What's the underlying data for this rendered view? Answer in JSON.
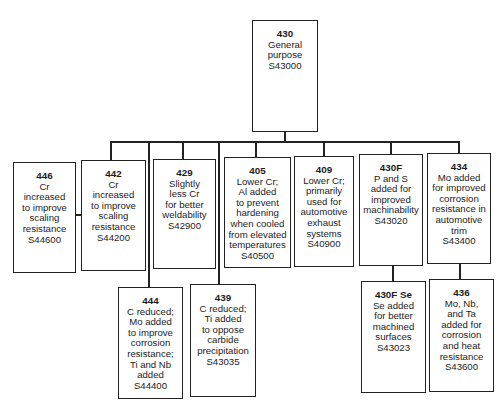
{
  "diagram": {
    "root": {
      "id": "430",
      "desc": "General\npurpose",
      "code": "S43000"
    },
    "level1": [
      {
        "id": "446",
        "desc": "Cr\nincreased\nto improve\nscaling\nresistance",
        "code": "S44600"
      },
      {
        "id": "442",
        "desc": "Cr\nincreased\nto improve\nscaling\nresistance",
        "code": "S44200"
      },
      {
        "id": "429",
        "desc": "Slightly\nless Cr\nfor better\nweldability",
        "code": "S42900"
      },
      {
        "id": "405",
        "desc": "Lower Cr;\nAl added\nto prevent\nhardening\nwhen cooled\nfrom elevated\ntemperatures",
        "code": "S40500"
      },
      {
        "id": "409",
        "desc": "Lower Cr;\nprimarily\nused for\nautomotive\nexhaust\nsystems",
        "code": "S40900"
      },
      {
        "id": "430F",
        "desc": "P and S\nadded for\nimproved\nmachinability",
        "code": "S43020"
      },
      {
        "id": "434",
        "desc": "Mo added\nfor improved\ncorrosion\nresistance in\nautomotive\ntrim",
        "code": "S43400"
      }
    ],
    "level2": [
      {
        "id": "444",
        "desc": "C reduced;\nMo added\nto improve\ncorrosion\nresistance;\nTi and Nb\nadded",
        "code": "S44400"
      },
      {
        "id": "439",
        "desc": "C reduced;\nTi added\nto oppose\ncarbide\nprecipitation",
        "code": "S43035"
      },
      {
        "id": "430F Se",
        "desc": "Se added\nfor better\nmachined\nsurfaces",
        "code": "S43023"
      },
      {
        "id": "436",
        "desc": "Mo, Nb,\nand Ta\nadded for\ncorrosion\nand heat\nresistance",
        "code": "S43600"
      }
    ]
  }
}
